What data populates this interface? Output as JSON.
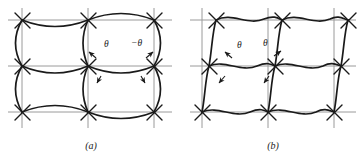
{
  "figure": {
    "kind": "lattice-deformation-diagram",
    "background_color": "#ffffff",
    "grid_line_color": "#9a9a9a",
    "curve_color": "#1a1a1a",
    "label_color": "#1a1a1a"
  },
  "panels": [
    {
      "id": "a",
      "caption": "(a)",
      "description": "Square lattice with outward-bulging arc bonds",
      "grid": {
        "x_nodes": [
          22,
          88,
          154
        ],
        "y_nodes": [
          20,
          66,
          112
        ],
        "columns": 2,
        "rows": 2
      },
      "annotations": [
        {
          "name": "theta-positive",
          "label": "θ",
          "x": 104,
          "y": 44
        },
        {
          "name": "theta-negative",
          "label": "−θ",
          "x": 136,
          "y": 43
        }
      ],
      "arrows": [
        {
          "name": "arrow-upper-left",
          "x1": 96,
          "y1": 58,
          "x2": 88,
          "y2": 51
        },
        {
          "name": "arrow-upper-right",
          "x1": 146,
          "y1": 58,
          "x2": 154,
          "y2": 51
        },
        {
          "name": "arrow-lower-left",
          "x1": 101,
          "y1": 76,
          "x2": 96,
          "y2": 84
        },
        {
          "name": "arrow-lower-right",
          "x1": 141,
          "y1": 76,
          "x2": 146,
          "y2": 84
        }
      ]
    },
    {
      "id": "b",
      "caption": "(b)",
      "description": "Sheared lattice with wavy bonds",
      "grid": {
        "x_nodes": [
          20,
          86,
          152
        ],
        "y_nodes": [
          20,
          66,
          112
        ],
        "columns": 2,
        "rows": 2,
        "shear": 14
      },
      "annotations": [
        {
          "name": "theta-left",
          "label": "θ",
          "x": 55,
          "y": 45
        },
        {
          "name": "theta-right",
          "label": "θ",
          "x": 82,
          "y": 43
        }
      ],
      "arrows": [
        {
          "name": "arrow-upper-left",
          "x1": 48,
          "y1": 58,
          "x2": 42,
          "y2": 52
        },
        {
          "name": "arrow-upper-right",
          "x1": 92,
          "y1": 56,
          "x2": 99,
          "y2": 50
        },
        {
          "name": "arrow-lower-left",
          "x1": 42,
          "y1": 76,
          "x2": 36,
          "y2": 84
        },
        {
          "name": "arrow-lower-right",
          "x1": 86,
          "y1": 76,
          "x2": 81,
          "y2": 84
        }
      ]
    }
  ]
}
